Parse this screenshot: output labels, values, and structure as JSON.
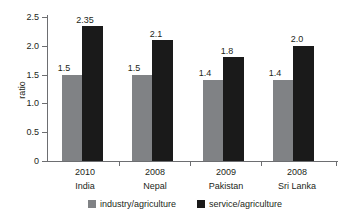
{
  "chart_data": {
    "type": "bar",
    "title": "",
    "subtitle": "",
    "xlabel": "",
    "ylabel": "ratio",
    "ylim": [
      0,
      2.5
    ],
    "yticks": [
      "0",
      "0.5",
      "1.0",
      "1.5",
      "2.0",
      "2.5"
    ],
    "ytick_values": [
      0,
      0.5,
      1.0,
      1.5,
      2.0,
      2.5
    ],
    "grid": false,
    "legend_position": "bottom",
    "categories": [
      "India",
      "Nepal",
      "Pakistan",
      "Sri Lanka"
    ],
    "category_years": [
      "2010",
      "2008",
      "2009",
      "2008"
    ],
    "series": [
      {
        "name": "industry/agriculture",
        "color": "#808285",
        "values": [
          1.5,
          1.5,
          1.4,
          1.4
        ],
        "labels": [
          "1.5",
          "1.5",
          "1.4",
          "1.4"
        ]
      },
      {
        "name": "service/agriculture",
        "color": "#1a1a1a",
        "values": [
          2.35,
          2.1,
          1.8,
          2.0
        ],
        "labels": [
          "2.35",
          "2.1",
          "1.8",
          "2.0"
        ]
      }
    ]
  },
  "axis": {
    "y_title": "ratio",
    "y_labels": {
      "t0": "0",
      "t1": "0.5",
      "t2": "1.0",
      "t3": "1.5",
      "t4": "2.0",
      "t5": "2.5"
    }
  },
  "groups": [
    {
      "year": "2010",
      "name": "India",
      "industry_label": "1.5",
      "service_label": "2.35"
    },
    {
      "year": "2008",
      "name": "Nepal",
      "industry_label": "1.5",
      "service_label": "2.1"
    },
    {
      "year": "2009",
      "name": "Pakistan",
      "industry_label": "1.4",
      "service_label": "1.8"
    },
    {
      "year": "2008",
      "name": "Sri Lanka",
      "industry_label": "1.4",
      "service_label": "2.0"
    }
  ],
  "legend": {
    "industry": "industry/agriculture",
    "service": "service/agriculture"
  }
}
